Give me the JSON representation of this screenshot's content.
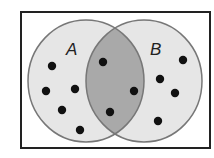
{
  "diagram": {
    "type": "venn",
    "sets": [
      {
        "label": "A",
        "only_count": 6
      },
      {
        "label": "B",
        "only_count": 5
      }
    ],
    "intersection_count": 3,
    "colors": {
      "circle_fill": "#e6e6e6",
      "intersection_fill": "#a9a9a9",
      "stroke": "#777777",
      "dot": "#111111",
      "frame": "#222222"
    }
  }
}
